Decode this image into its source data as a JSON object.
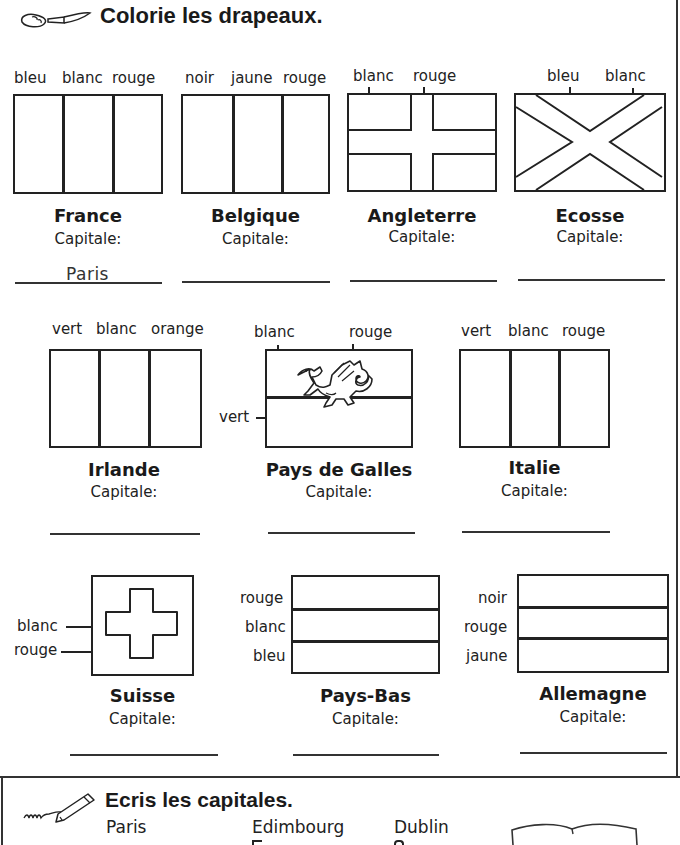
{
  "section1": {
    "title": "Colorie les drapeaux.",
    "icon": "paintbrush-icon"
  },
  "capital_label": "Capitale:",
  "flags": [
    {
      "country": "France",
      "colors": [
        "bleu",
        "blanc",
        "rouge"
      ],
      "answer": "Paris"
    },
    {
      "country": "Belgique",
      "colors": [
        "noir",
        "jaune",
        "rouge"
      ],
      "answer": ""
    },
    {
      "country": "Angleterre",
      "colors": [
        "blanc",
        "rouge"
      ],
      "answer": ""
    },
    {
      "country": "Ecosse",
      "colors": [
        "bleu",
        "blanc"
      ],
      "answer": ""
    },
    {
      "country": "Irlande",
      "colors": [
        "vert",
        "blanc",
        "orange"
      ],
      "answer": ""
    },
    {
      "country": "Pays de Galles",
      "colors": [
        "blanc",
        "rouge",
        "vert"
      ],
      "answer": ""
    },
    {
      "country": "Italie",
      "colors": [
        "vert",
        "blanc",
        "rouge"
      ],
      "answer": ""
    },
    {
      "country": "Suisse",
      "colors": [
        "blanc",
        "rouge"
      ],
      "answer": ""
    },
    {
      "country": "Pays-Bas",
      "colors": [
        "rouge",
        "blanc",
        "bleu"
      ],
      "answer": ""
    },
    {
      "country": "Allemagne",
      "colors": [
        "noir",
        "rouge",
        "jaune"
      ],
      "answer": ""
    }
  ],
  "section2": {
    "title": "Ecris les capitales.",
    "icon": "pencil-icon",
    "capitals_visible": [
      "Paris",
      "Edimbourg",
      "Dublin"
    ],
    "decor_icon": "open-book-icon"
  }
}
